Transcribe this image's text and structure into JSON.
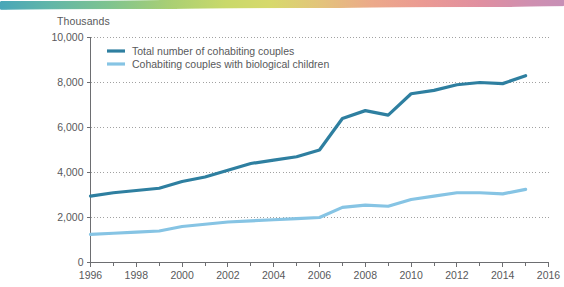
{
  "chart_data": {
    "type": "line",
    "title": "",
    "subtitle": "",
    "unit_caption": "Thousands",
    "xlabel": "",
    "ylabel": "",
    "xlim": [
      1996,
      2016
    ],
    "ylim": [
      0,
      10000
    ],
    "grid": true,
    "legend_position": "top-left",
    "x": [
      1996,
      1997,
      1998,
      1999,
      2000,
      2001,
      2002,
      2003,
      2004,
      2005,
      2006,
      2007,
      2008,
      2009,
      2010,
      2011,
      2012,
      2013,
      2014,
      2015
    ],
    "y_ticks": [
      0,
      2000,
      4000,
      6000,
      8000,
      10000
    ],
    "y_tick_labels": [
      "0",
      "2,000",
      "4,000",
      "6,000",
      "8,000",
      "10,000"
    ],
    "x_ticks": [
      1996,
      1998,
      2000,
      2002,
      2004,
      2006,
      2008,
      2010,
      2012,
      2014,
      2016
    ],
    "x_tick_labels": [
      "1996",
      "1998",
      "2000",
      "2002",
      "2004",
      "2006",
      "2008",
      "2010",
      "2012",
      "2014",
      "2016"
    ],
    "x_minor_ticks": [
      1997,
      1999,
      2001,
      2003,
      2005,
      2007,
      2009,
      2011,
      2013,
      2015
    ],
    "series": [
      {
        "name": "Total number of cohabiting couples",
        "color": "#2e7fa0",
        "width": 3.2,
        "values": [
          2950,
          3100,
          3200,
          3300,
          3600,
          3800,
          4100,
          4400,
          4550,
          4700,
          5000,
          6400,
          6750,
          6550,
          7500,
          7650,
          7900,
          8000,
          7950,
          8300
        ]
      },
      {
        "name": "Cohabiting couples with biological children",
        "color": "#86c4e4",
        "width": 3.2,
        "values": [
          1250,
          1300,
          1350,
          1400,
          1600,
          1700,
          1800,
          1850,
          1900,
          1950,
          2000,
          2450,
          2550,
          2500,
          2800,
          2950,
          3100,
          3100,
          3050,
          3250
        ]
      }
    ]
  },
  "legend": {
    "items": [
      {
        "label": "Total number of cohabiting couples",
        "color": "#2e7fa0"
      },
      {
        "label": "Cohabiting couples with biological children",
        "color": "#86c4e4"
      }
    ]
  },
  "colors": {
    "axis": "#6d6e71",
    "grid": "#8a8a8a",
    "text": "#58595b",
    "series_dark": "#2e7fa0",
    "series_light": "#86c4e4",
    "background": "#ffffff"
  }
}
